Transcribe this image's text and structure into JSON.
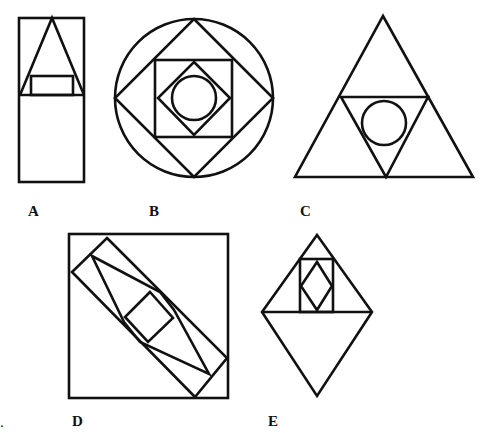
{
  "figures": [
    {
      "id": "A",
      "label": "A",
      "description": "Rectangle divided horizontally; upper half contains triangle with small rectangle at its base"
    },
    {
      "id": "B",
      "label": "B",
      "description": "Circle with inscribed diamond, square, smaller diamond, and inner circle"
    },
    {
      "id": "C",
      "label": "C",
      "description": "Triangle with inverted inner triangle containing a circle"
    },
    {
      "id": "D",
      "label": "D",
      "description": "Square containing diagonal rotated rectangle with elongated polygon and small rotated square"
    },
    {
      "id": "E",
      "label": "E",
      "description": "Diamond split horizontally; upper triangle contains a rectangle with an inner diamond"
    }
  ],
  "labels": {
    "a": "A",
    "b": "B",
    "c": "C",
    "d": "D",
    "e": "E",
    "stray_mark": "."
  },
  "colors": {
    "stroke": "#111111",
    "background": "#ffffff"
  }
}
